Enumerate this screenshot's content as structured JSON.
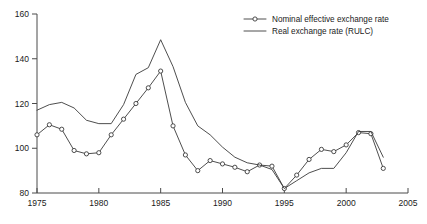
{
  "chart_data": {
    "type": "line",
    "title": "",
    "subtitle": "",
    "xlabel": "",
    "ylabel": "",
    "xlim": [
      1975,
      2005
    ],
    "ylim": [
      80,
      160
    ],
    "xticks": [
      1975,
      1980,
      1985,
      1990,
      1995,
      2000,
      2005
    ],
    "yticks": [
      80,
      100,
      120,
      140,
      160
    ],
    "xtick_labels": [
      "1975",
      "1980",
      "1985",
      "1990",
      "1995",
      "2000",
      "2005"
    ],
    "ytick_labels": [
      "80",
      "100",
      "120",
      "140",
      "160"
    ],
    "grid": false,
    "legend_position": "top-right",
    "x": [
      1975,
      1976,
      1977,
      1978,
      1979,
      1980,
      1981,
      1982,
      1983,
      1984,
      1985,
      1986,
      1987,
      1988,
      1989,
      1990,
      1991,
      1992,
      1993,
      1994,
      1995,
      1996,
      1997,
      1998,
      1999,
      2000,
      2001,
      2002,
      2003
    ],
    "series": [
      {
        "name": "Nominal effective exchange rate",
        "marker": "circle",
        "values": [
          106,
          110.5,
          108.5,
          99,
          97.5,
          98,
          106,
          113,
          120,
          127,
          134.5,
          110,
          97,
          90,
          94.5,
          93,
          91.5,
          89.5,
          92.5,
          92,
          82,
          88,
          95,
          99.5,
          98.5,
          101.5,
          107,
          106.5,
          91
        ]
      },
      {
        "name": "Real exchange rate (RULC)",
        "marker": "none",
        "values": [
          117,
          119.5,
          120.5,
          118,
          112.5,
          111,
          111,
          119.5,
          133,
          136,
          148.5,
          136.5,
          120.5,
          110,
          106,
          100.5,
          96,
          93.5,
          92.5,
          90.5,
          82,
          85.5,
          89,
          91,
          91,
          98,
          107.5,
          107.5,
          96
        ]
      }
    ]
  },
  "legend": {
    "items": [
      {
        "label": "Nominal effective exchange rate",
        "marker": "circle"
      },
      {
        "label": "Real exchange rate (RULC)",
        "marker": "none"
      }
    ]
  }
}
